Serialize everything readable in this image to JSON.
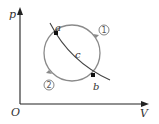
{
  "diagram": {
    "type": "p-V diagram",
    "axes": {
      "y_label": "p",
      "x_label": "V",
      "origin_label": "O"
    },
    "points": [
      {
        "label": "a",
        "x": 56,
        "y": 33
      },
      {
        "label": "b",
        "x": 93,
        "y": 75
      }
    ],
    "curve_label": "c",
    "processes": [
      {
        "label": "1",
        "path": "upper-right arc from a to b (clockwise)"
      },
      {
        "label": "2",
        "path": "lower-left arc from b to a"
      }
    ],
    "colors": {
      "axis": "#222222",
      "circle": "#8a8a8a",
      "curve": "#444444",
      "text": "#333333"
    }
  }
}
